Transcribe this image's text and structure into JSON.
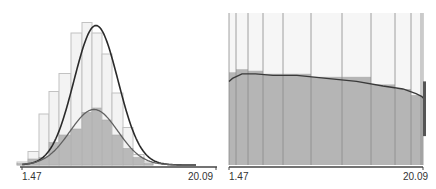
{
  "colors": {
    "outer_bar_fill": "#f3f3f3",
    "outer_bar_stroke": "#c2c2c2",
    "inner_bar_fill": "#b9b9b9",
    "inner_bar_stroke": "#a8a8a8",
    "curve_outer": "#2a2a2a",
    "curve_inner": "#606060",
    "axis": "#444444",
    "right_bg": "#f6f6f6",
    "right_fill": "#b5b5b5",
    "right_lines": "#8a8a8a"
  },
  "chart_data": [
    {
      "type": "bar",
      "title": "",
      "xlabel": "",
      "ylabel": "",
      "x_range": [
        1.47,
        20.09
      ],
      "x_tick_labels": [
        "1.47",
        "20.09"
      ],
      "grid": false,
      "legend": null,
      "description": "Histogram with two overlaid series (outer light bins and inner gray bins) with fitted normal density curves",
      "bins_px": [
        [
          17,
          28
        ],
        [
          28,
          39
        ],
        [
          39,
          49
        ],
        [
          49,
          59
        ],
        [
          59,
          71
        ],
        [
          71,
          82
        ],
        [
          82,
          92
        ],
        [
          92,
          102
        ],
        [
          102,
          112
        ],
        [
          112,
          123
        ],
        [
          123,
          133
        ],
        [
          133,
          144
        ],
        [
          144,
          153
        ]
      ],
      "series": [
        {
          "name": "outer",
          "relative_heights": [
            0.02,
            0.09,
            0.34,
            0.49,
            0.61,
            0.88,
            0.95,
            0.88,
            0.74,
            0.48,
            0.25,
            0.07,
            0.02
          ]
        },
        {
          "name": "inner",
          "relative_heights": [
            0.01,
            0.04,
            0.05,
            0.15,
            0.2,
            0.24,
            0.35,
            0.38,
            0.3,
            0.2,
            0.11,
            0.05,
            0.01
          ]
        }
      ],
      "curves": [
        {
          "name": "outer-fit",
          "peak_rel": 0.93,
          "center_px": 96,
          "sigma_px": 22
        },
        {
          "name": "inner-fit",
          "peak_rel": 0.37,
          "center_px": 94,
          "sigma_px": 24
        }
      ]
    },
    {
      "type": "bar",
      "title": "",
      "xlabel": "",
      "ylabel": "",
      "x_range": [
        1.47,
        20.09
      ],
      "x_tick_labels": [
        "1.47",
        "20.09"
      ],
      "grid": false,
      "legend": null,
      "description": "Normalized (100% height) bars of varying width showing inner share with smooth fitted ratio curve",
      "bin_edges_px": [
        229,
        236,
        248,
        263,
        283,
        311,
        342,
        371,
        395,
        411,
        421,
        423
      ],
      "inner_share": [
        0.61,
        0.63,
        0.62,
        0.6,
        0.6,
        0.58,
        0.58,
        0.53,
        0.5,
        0.46,
        0.45
      ],
      "curve_share": [
        0.57,
        0.6,
        0.6,
        0.59,
        0.59,
        0.57,
        0.55,
        0.52,
        0.5,
        0.47,
        0.45
      ]
    }
  ],
  "left": {
    "tick_min": "1.47",
    "tick_max": "20.09"
  },
  "right": {
    "tick_min": "1.47",
    "tick_max": "20.09"
  }
}
